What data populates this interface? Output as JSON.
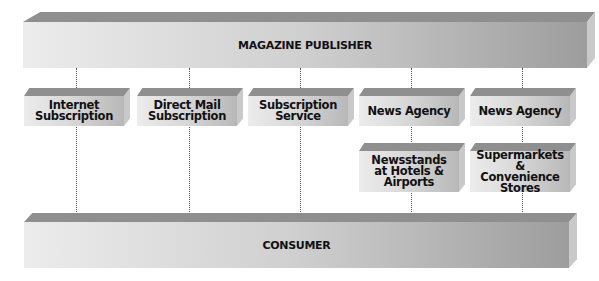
{
  "diagram": {
    "top": {
      "label": "MAGAZINE PUBLISHER"
    },
    "bottom": {
      "label": "CONSUMER"
    },
    "channels": [
      {
        "label": "Internet Subscription"
      },
      {
        "label": "Direct Mail Subscription"
      },
      {
        "label": "Subscription Service"
      },
      {
        "label": "News Agency",
        "sub": "Newsstands at Hotels & Airports"
      },
      {
        "label": "News Agency",
        "sub": "Supermarkets & Convenience Stores"
      }
    ]
  },
  "colors": {
    "top_face": "#8f8f8f",
    "front_light": "#ececec",
    "front_dark": "#b8b8b8",
    "text": "#111111"
  }
}
